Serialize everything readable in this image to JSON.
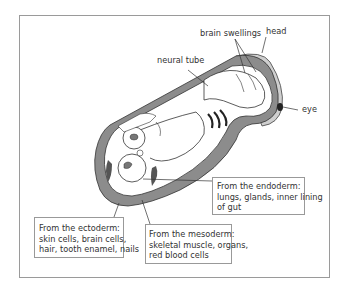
{
  "figure": {
    "labels": {
      "brain_swellings": "brain swellings",
      "head": "head",
      "neural_tube": "neural tube",
      "eye": "eye"
    },
    "boxes": {
      "endoderm": {
        "title": "From the endoderm:",
        "line1": "lungs, glands, inner lining",
        "line2": "of gut"
      },
      "ectoderm": {
        "title": "From the ectoderm:",
        "line1": "skin cells, brain cells,",
        "line2": "hair, tooth enamel, nails"
      },
      "mesoderm": {
        "title": "From the mesoderm:",
        "line1": "skeletal muscle, organs,",
        "line2": "red blood cells"
      }
    },
    "colors": {
      "outer_gray": "#8c8c8c",
      "light_gray": "#c8c8c8",
      "line": "#333333"
    }
  }
}
